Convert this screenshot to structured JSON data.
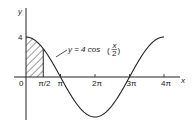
{
  "chart_data": {
    "type": "line",
    "title": "",
    "xlabel": "x",
    "ylabel": "y",
    "function": "y = 4 cos(x/2)",
    "annotation": {
      "text_prefix": "y = 4 cos",
      "frac_num": "x",
      "frac_den": "2"
    },
    "x_ticks": [
      {
        "label": "0",
        "value": 0
      },
      {
        "label": "π/2",
        "value": 1.5708
      },
      {
        "label": "π",
        "value": 3.1416
      },
      {
        "label": "2π",
        "value": 6.2832
      },
      {
        "label": "3π",
        "value": 9.4248
      },
      {
        "label": "4π",
        "value": 12.5664
      }
    ],
    "y_ticks": [
      {
        "label": "4",
        "value": 4
      }
    ],
    "xlim": [
      0,
      13.2
    ],
    "ylim": [
      -4,
      4.8
    ],
    "shaded_region": {
      "from": 0,
      "to": 1.5708,
      "pattern": "diagonal-hatch"
    },
    "series": [
      {
        "name": "y = 4cos(x/2)",
        "x": [
          0,
          1.5708,
          3.1416,
          4.7124,
          6.2832,
          7.854,
          9.4248,
          11.0,
          12.5664
        ],
        "y": [
          4,
          2.83,
          0,
          -2.83,
          -4,
          -2.83,
          0,
          2.83,
          4
        ]
      }
    ],
    "grid": false,
    "legend": "none"
  }
}
